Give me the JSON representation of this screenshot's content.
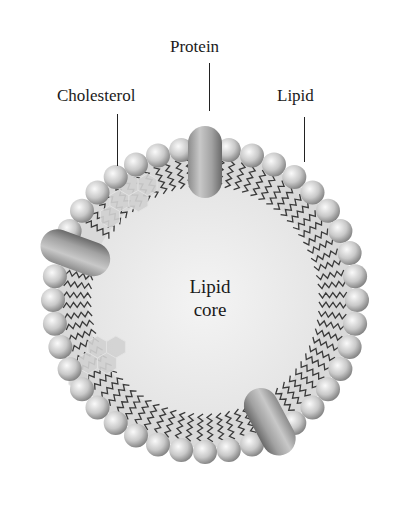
{
  "diagram": {
    "labels": {
      "protein": "Protein",
      "cholesterol": "Cholesterol",
      "lipid": "Lipid",
      "core_line1": "Lipid",
      "core_line2": "core"
    },
    "geometry": {
      "center_x": 205,
      "center_y": 300,
      "bead_ring_radius": 152,
      "bead_radius": 12,
      "bead_count": 40,
      "tail_inner_radius": 112,
      "core_radius": 118
    },
    "proteins": [
      {
        "name": "top-protein",
        "angle_deg": -90
      },
      {
        "name": "left-protein",
        "angle_deg": 200
      },
      {
        "name": "bottom-protein",
        "angle_deg": 62
      }
    ],
    "cholesterol_clusters": [
      {
        "name": "upper-left-cholesterol",
        "angle_deg": 232
      },
      {
        "name": "lower-left-cholesterol",
        "angle_deg": 150
      }
    ],
    "colors": {
      "bead_light": "#f2f2f2",
      "bead_dark": "#8a8a8a",
      "core_fill": "#ececec",
      "tail_band": "#d9d9d9",
      "tail_stroke": "#3a3a3a",
      "protein_light": "#c4c4c4",
      "protein_dark": "#6e6e6e",
      "hexagon_fill": "#d2d2d2",
      "hexagon_stroke": "#e4e4e4",
      "text": "#1a1a1a"
    }
  }
}
